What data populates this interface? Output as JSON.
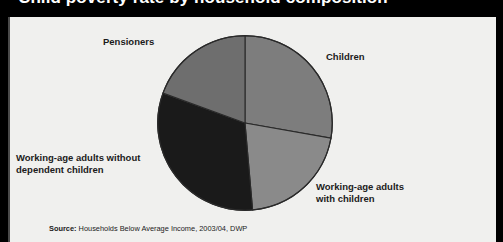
{
  "figure": {
    "title": "Child poverty rate by household composition",
    "background_color": "#f0f0ee",
    "band_color": "#000000"
  },
  "source": {
    "label": "Source:",
    "text": " Households Below Average Income, 2003/04, DWP"
  },
  "labels": {
    "pensioners": "Pensioners",
    "children": "Children",
    "working_age_without": "Working-age adults without\ndependent children",
    "working_age_with": "Working-age adults\nwith children"
  },
  "chart_data": {
    "type": "pie",
    "title": "Child poverty rate by household composition",
    "categories": [
      "Children",
      "Working-age adults with children",
      "Working-age adults without dependent children",
      "Pensioners"
    ],
    "values": [
      28,
      21,
      32,
      19
    ],
    "units": "percent",
    "start_angle_deg": 0,
    "direction": "clockwise",
    "slices": [
      {
        "name": "Children",
        "value": 28,
        "start_deg": 0,
        "end_deg": 100,
        "color": "#7d7d7d",
        "label_position": "right"
      },
      {
        "name": "Working-age adults with children",
        "value": 21,
        "start_deg": 100,
        "end_deg": 175,
        "color": "#8a8a8a",
        "label_position": "bottom-right"
      },
      {
        "name": "Working-age adults without dependent children",
        "value": 32,
        "start_deg": 175,
        "end_deg": 290,
        "color": "#1a1a1a",
        "label_position": "left"
      },
      {
        "name": "Pensioners",
        "value": 19,
        "start_deg": 290,
        "end_deg": 360,
        "color": "#6e6e6e",
        "label_position": "top-left"
      }
    ],
    "legend": "none",
    "grid": false,
    "xlabel": "",
    "ylabel": ""
  }
}
